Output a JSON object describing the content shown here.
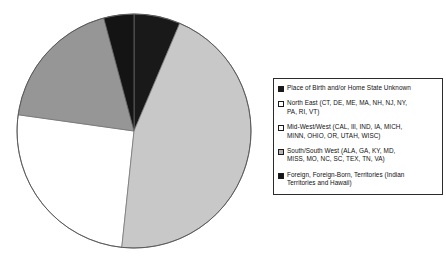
{
  "chart_data": {
    "type": "pie",
    "title": "",
    "subtitle": "",
    "xlabel": "",
    "ylabel": "",
    "legend_position": "right",
    "grid": false,
    "labels": [
      "Place of Birth and/or Home State Unknown",
      "North East (CT, DE, ME, MA, NH, NJ, NY, PA, RI, VT)",
      "Mid-West/West (CAL, Ill, IND, IA, MICH, MINN, OHIO, OR, UTAH, WISC)",
      "South/South West (ALA, GA, KY, MD, MISS, MO, NC, SC, TEX, TN, VA)",
      "Foreign, Foreign-Born, Territories (Indian Territories and Hawaii)"
    ],
    "values": [
      6.4,
      25.6,
      18.6,
      45.3,
      4.1
    ],
    "start_angles_deg": [
      0,
      186,
      278,
      23,
      345
    ],
    "end_angles_deg": [
      23,
      278,
      345,
      186,
      360
    ],
    "colors": [
      "#191919",
      "#ffffff",
      "#969696",
      "#c8c8c8",
      "#141414"
    ],
    "slice_order_clockwise_from_top": [
      "Place of Birth and/or Home State Unknown",
      "South/South West (ALA, GA, KY, MD, MISS, MO, NC, SC, TEX, TN, VA)",
      "North East (CT, DE, ME, MA, NH, NJ, NY, PA, RI, VT)",
      "Mid-West/West (CAL, Ill, IND, IA, MICH, MINN, OHIO, OR, UTAH, WISC)",
      "Foreign, Foreign-Born, Territories (Indian Territories and Hawaii)"
    ]
  },
  "pie": {
    "center_x": 134,
    "center_y": 131,
    "radius": 117,
    "outline_color": "#5a5a5a"
  },
  "legend": {
    "border_color": "#2b2b2b",
    "items": [
      {
        "label": "Place of Birth and/or Home State Unknown",
        "swatch_color": "#191919",
        "swatch_name": "swatch-place-of-birth-unknown"
      },
      {
        "label": "North East (CT, DE, ME, MA, NH, NJ, NY,\nPA, RI, VT)",
        "swatch_color": "#ffffff",
        "swatch_name": "swatch-north-east"
      },
      {
        "label": "Mid-West/West (CAL, Ill, IND, IA, MICH,\nMINN, OHIO, OR, UTAH, WISC)",
        "swatch_color": "#fbfbfb",
        "swatch_name": "swatch-mid-west-west"
      },
      {
        "label": "South/South West (ALA, GA, KY, MD,\nMISS, MO, NC, SC, TEX, TN, VA)",
        "swatch_color": "#b4b4b4",
        "swatch_name": "swatch-south-south-west"
      },
      {
        "label": "Foreign, Foreign-Born, Territories (Indian\nTerritories and Hawaii)",
        "swatch_color": "#141414",
        "swatch_name": "swatch-foreign-born"
      }
    ]
  }
}
